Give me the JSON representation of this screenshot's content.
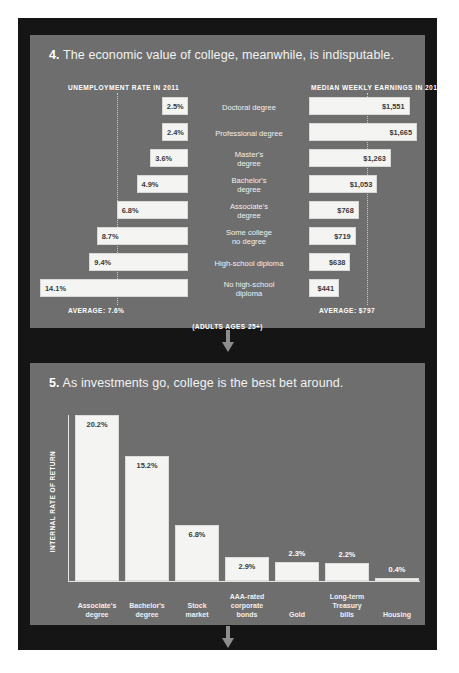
{
  "panels": [
    {
      "number": "4.",
      "title": "The economic value of college, meanwhile, is indisputable.",
      "left_heading": "UNEMPLOYMENT RATE IN 2011",
      "right_heading": "MEDIAN WEEKLY EARNINGS IN 2011",
      "left_average_label": "AVERAGE: 7.6%",
      "right_average_label": "AVERAGE: $797",
      "footnote": "(ADULTS AGES 25+)"
    },
    {
      "number": "5.",
      "title": "As investments go, college is the best bet around.",
      "y_axis_title": "INTERNAL RATE OF RETURN"
    }
  ],
  "chart_data": [
    {
      "type": "bar",
      "orientation": "horizontal-paired",
      "title": "The economic value of college, meanwhile, is indisputable.",
      "categories": [
        "Doctoral degree",
        "Professional degree",
        "Master's degree",
        "Bachelor's degree",
        "Associate's degree",
        "Some college no degree",
        "High-school diploma",
        "No high-school diploma"
      ],
      "category_lines": [
        [
          "Doctoral degree"
        ],
        [
          "Professional degree"
        ],
        [
          "Master's",
          "degree"
        ],
        [
          "Bachelor's",
          "degree"
        ],
        [
          "Associate's",
          "degree"
        ],
        [
          "Some college",
          "no degree"
        ],
        [
          "High-school diploma"
        ],
        [
          "No high-school",
          "diploma"
        ]
      ],
      "series": [
        {
          "name": "UNEMPLOYMENT RATE IN 2011",
          "unit": "%",
          "values": [
            2.5,
            2.4,
            3.6,
            4.9,
            6.8,
            8.7,
            9.4,
            14.1
          ],
          "labels": [
            "2.5%",
            "2.4%",
            "3.6%",
            "4.9%",
            "6.8%",
            "8.7%",
            "9.4%",
            "14.1%"
          ],
          "average": 7.6,
          "average_label": "AVERAGE: 7.6%",
          "max": 14.1
        },
        {
          "name": "MEDIAN WEEKLY EARNINGS IN 2011",
          "unit": "$",
          "values": [
            1551,
            1665,
            1263,
            1053,
            768,
            719,
            638,
            441
          ],
          "labels": [
            "$1,551",
            "$1,665",
            "$1,263",
            "$1,053",
            "$768",
            "$719",
            "$638",
            "$441"
          ],
          "average": 797,
          "average_label": "AVERAGE: $797",
          "max": 1665
        }
      ],
      "annotation": "(ADULTS AGES 25+)",
      "grid": false,
      "legend": "none"
    },
    {
      "type": "bar",
      "orientation": "vertical",
      "title": "As investments go, college is the best bet around.",
      "ylabel": "INTERNAL RATE OF RETURN",
      "xlabel": "",
      "categories": [
        "Associate's degree",
        "Bachelor's degree",
        "Stock market",
        "AAA-rated corporate bonds",
        "Gold",
        "Long-term Treasury bills",
        "Housing"
      ],
      "category_lines": [
        [
          "Associate's",
          "degree"
        ],
        [
          "Bachelor's",
          "degree"
        ],
        [
          "Stock",
          "market"
        ],
        [
          "AAA-rated",
          "corporate",
          "bonds"
        ],
        [
          "Gold"
        ],
        [
          "Long-term",
          "Treasury",
          "bills"
        ],
        [
          "Housing"
        ]
      ],
      "values": [
        20.2,
        15.2,
        6.8,
        2.9,
        2.3,
        2.2,
        0.4
      ],
      "labels": [
        "20.2%",
        "15.2%",
        "6.8%",
        "2.9%",
        "2.3%",
        "2.2%",
        "0.4%"
      ],
      "label_position": [
        "inside",
        "inside",
        "inside",
        "inside",
        "outside",
        "outside",
        "outside"
      ],
      "ylim": [
        0,
        20.2
      ],
      "grid": false,
      "legend": "none"
    }
  ],
  "colors": {
    "page_background": "#ffffff",
    "frame": "#151515",
    "panel": "#6e6e6e",
    "bar_fill": "#f4f4f2",
    "bar_value_text": "#3a3a3a",
    "panel_text": "#ffffff",
    "arrow": "#8d8d8d",
    "axis": "#e4e4e4",
    "guide_line": "#c9c9c9"
  }
}
